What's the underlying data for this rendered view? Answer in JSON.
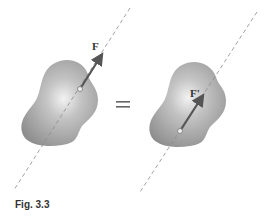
{
  "figure": {
    "caption": "Fig. 3.3",
    "equals_sign": "=",
    "left_body": {
      "force_label": "F",
      "description": "rigid body with force F applied at a point along its line of action"
    },
    "right_body": {
      "force_label": "F'",
      "description": "same rigid body with equivalent force F' applied at a different point on the same line of action"
    },
    "colors": {
      "body_fill": "#9a9a9a",
      "body_highlight": "#e8e8e8",
      "arrow": "#555555",
      "line_of_action": "#8a8a8a",
      "text": "#333333"
    }
  }
}
